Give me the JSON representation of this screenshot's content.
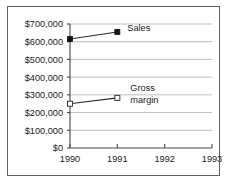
{
  "chart_data": {
    "type": "line",
    "title": "",
    "xlabel": "",
    "ylabel": "",
    "categories": [
      "1990",
      "1991",
      "1992",
      "1993"
    ],
    "x": [
      1990,
      1991,
      1992,
      1993
    ],
    "ylim": [
      0,
      700000
    ],
    "xlim": [
      1990,
      1993
    ],
    "grid": true,
    "grid_axis": "y",
    "legend_position": "inline-annotation",
    "y_tick_labels": [
      "$700,000",
      "$600,000",
      "$500,000",
      "$400,000",
      "$300,000",
      "$200,000",
      "$100,000",
      "$0"
    ],
    "y_tick_values": [
      700000,
      600000,
      500000,
      400000,
      300000,
      200000,
      100000,
      0
    ],
    "x_tick_labels": [
      "1990",
      "1991",
      "1992",
      "1993"
    ],
    "series": [
      {
        "name": "Sales",
        "label": "Sales",
        "marker": "filled-square",
        "marker_color": "#141210",
        "line_color": "#2b2927",
        "x": [
          1990,
          1991
        ],
        "values": [
          615000,
          655000
        ]
      },
      {
        "name": "Gross margin",
        "label_line1": "Gross",
        "label_line2": "margin",
        "marker": "hollow-square",
        "marker_color": "#ffffff",
        "marker_edge_color": "#3a3836",
        "line_color": "#2b2927",
        "x": [
          1990,
          1991
        ],
        "values": [
          250000,
          283000
        ]
      }
    ],
    "annotations": [
      {
        "text": "Sales",
        "for_series": "Sales"
      },
      {
        "text": "Gross margin",
        "for_series": "Gross margin"
      }
    ]
  },
  "colors": {
    "background": "#ffffff",
    "frame_border": "#63615f",
    "gridline": "#b9b7b5",
    "axis": "#4a4846",
    "text": "#1d1b19"
  }
}
